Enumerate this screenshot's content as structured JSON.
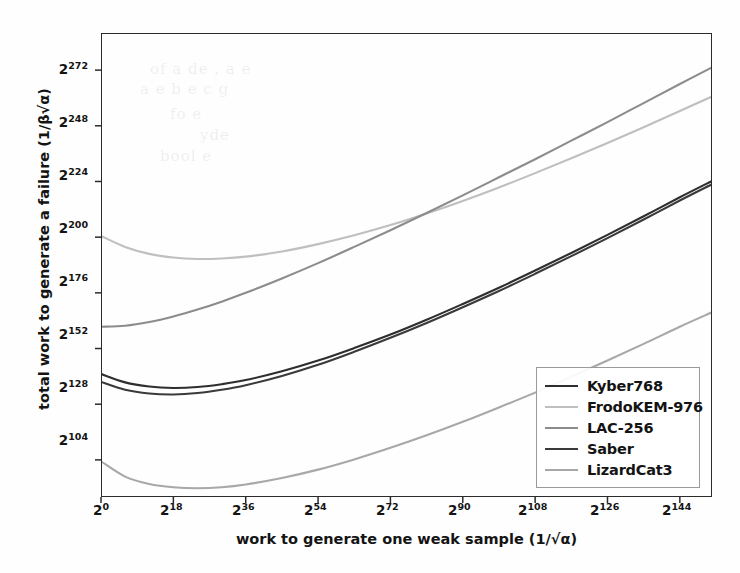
{
  "chart_data": {
    "type": "line",
    "title": "",
    "xlabel": "work to generate one weak sample (1/√α)",
    "ylabel": "total work to generate a failure (1/β√α)",
    "x_scale": "log2",
    "y_scale": "log2",
    "xlim": [
      0,
      152
    ],
    "ylim": [
      88,
      288
    ],
    "grid": false,
    "legend_position": "lower right",
    "xticks": [
      0,
      18,
      36,
      54,
      72,
      90,
      108,
      126,
      144
    ],
    "xtick_labels": [
      "2^0",
      "2^18",
      "2^36",
      "2^54",
      "2^72",
      "2^90",
      "2^108",
      "2^126",
      "2^144"
    ],
    "yticks": [
      104,
      128,
      152,
      176,
      200,
      224,
      248,
      272
    ],
    "ytick_labels": [
      "2^104",
      "2^128",
      "2^152",
      "2^176",
      "2^200",
      "2^224",
      "2^248",
      "2^272"
    ],
    "axis_note": "x and y values are exponents of 2",
    "series": [
      {
        "name": "Kyber768",
        "color": "#2e2e2e",
        "linewidth": 2.1,
        "x": [
          0,
          6,
          12,
          18,
          24,
          30,
          36,
          45,
          54,
          63,
          72,
          81,
          90,
          99,
          108,
          117,
          126,
          135,
          144,
          152
        ],
        "y": [
          141.0,
          137.4,
          135.6,
          135.0,
          135.4,
          136.6,
          138.4,
          142.2,
          146.8,
          152.2,
          158.0,
          164.4,
          171.2,
          178.2,
          185.6,
          193.2,
          201.0,
          209.0,
          217.2,
          224.2
        ]
      },
      {
        "name": "FrodoKEM-976",
        "color": "#bfbfbf",
        "linewidth": 2.1,
        "x": [
          0,
          6,
          12,
          18,
          24,
          30,
          36,
          45,
          54,
          63,
          72,
          81,
          90,
          99,
          108,
          117,
          126,
          135,
          144,
          152
        ],
        "y": [
          200.5,
          195.8,
          192.8,
          191.2,
          190.6,
          190.8,
          191.6,
          193.8,
          197.0,
          200.8,
          205.2,
          210.2,
          215.6,
          221.4,
          227.6,
          234.0,
          240.6,
          247.4,
          254.4,
          260.6
        ]
      },
      {
        "name": "LAC-256",
        "color": "#8c8c8c",
        "linewidth": 2.1,
        "x": [
          0,
          6,
          12,
          18,
          24,
          30,
          36,
          45,
          54,
          63,
          72,
          81,
          90,
          99,
          108,
          117,
          126,
          135,
          144,
          152
        ],
        "y": [
          161.4,
          161.8,
          163.4,
          165.8,
          168.8,
          172.2,
          176.0,
          182.2,
          188.8,
          195.8,
          203.0,
          210.4,
          218.0,
          225.8,
          233.6,
          241.6,
          249.6,
          257.8,
          266.0,
          273.2
        ]
      },
      {
        "name": "Saber",
        "color": "#3a3a3a",
        "linewidth": 2.1,
        "x": [
          0,
          6,
          12,
          18,
          24,
          30,
          36,
          45,
          54,
          63,
          72,
          81,
          90,
          99,
          108,
          117,
          126,
          135,
          144,
          152
        ],
        "y": [
          137.6,
          134.2,
          132.6,
          132.2,
          132.8,
          134.2,
          136.2,
          140.2,
          145.0,
          150.6,
          156.6,
          163.0,
          169.8,
          176.8,
          184.2,
          191.8,
          199.6,
          207.6,
          215.8,
          222.8
        ]
      },
      {
        "name": "LizardCat3",
        "color": "#a8a8a8",
        "linewidth": 2.1,
        "x": [
          0,
          6,
          12,
          18,
          24,
          30,
          36,
          45,
          54,
          63,
          72,
          81,
          90,
          99,
          108,
          117,
          126,
          135,
          144,
          152
        ],
        "y": [
          103.4,
          96.8,
          93.6,
          92.2,
          91.8,
          92.2,
          93.4,
          96.2,
          99.8,
          104.2,
          109.2,
          114.6,
          120.4,
          126.6,
          133.0,
          139.8,
          146.8,
          154.0,
          161.4,
          167.6
        ]
      }
    ]
  },
  "legend": {
    "items": [
      {
        "label": "Kyber768"
      },
      {
        "label": "FrodoKEM-976"
      },
      {
        "label": "LAC-256"
      },
      {
        "label": "Saber"
      },
      {
        "label": "LizardCat3"
      }
    ]
  },
  "axes": {
    "ylabel_text": "total work to generate a failure (1/β√α)",
    "xlabel_text": "work to generate one weak sample (1/√α)"
  }
}
